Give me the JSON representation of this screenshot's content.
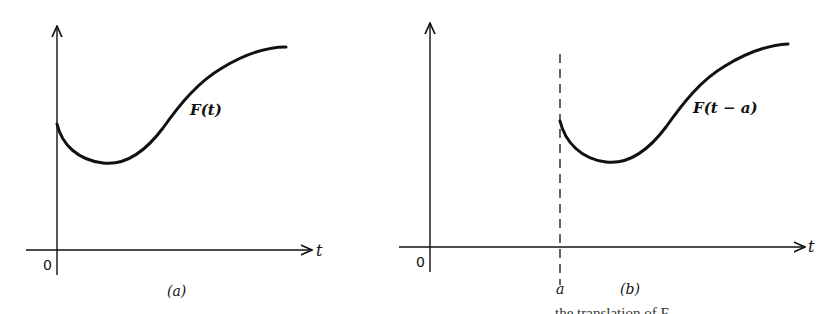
{
  "figure": {
    "panel_a": {
      "caption": "(a)",
      "function_label": "F(t)",
      "x_axis_label": "t",
      "origin_label": "0"
    },
    "panel_b": {
      "caption": "(b)",
      "function_label": "F(t − a)",
      "x_axis_label": "t",
      "origin_label": "0",
      "shift_label": "a"
    },
    "clipped_caption_text": "…the translation of F…"
  },
  "colors": {
    "ink": "#111111",
    "background": "#ffffff"
  }
}
